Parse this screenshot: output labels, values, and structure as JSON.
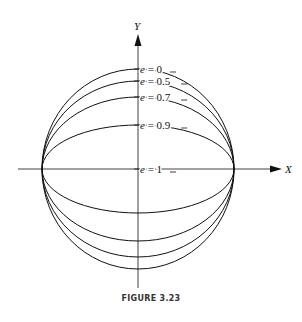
{
  "figure": {
    "caption": "FIGURE 3.23",
    "x_axis_label": "X",
    "y_axis_label": "Y",
    "center": [
      138,
      169
    ],
    "semi_major_px": 96,
    "curves": [
      {
        "label": "e = 0",
        "e": 0,
        "semi_minor_px": 100
      },
      {
        "label": "e = 0.5",
        "e": 0.5,
        "semi_minor_px": 88
      },
      {
        "label": "e = 0.7",
        "e": 0.7,
        "semi_minor_px": 72
      },
      {
        "label": "e = 0.9",
        "e": 0.9,
        "semi_minor_px": 44
      },
      {
        "label": "e = 1",
        "e": 1,
        "semi_minor_px": 0
      }
    ],
    "line_color": "#111111"
  }
}
